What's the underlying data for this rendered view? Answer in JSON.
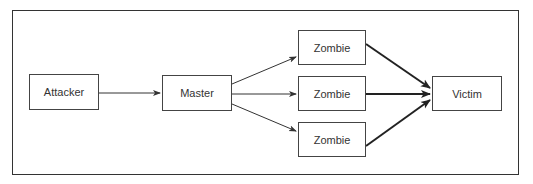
{
  "diagram": {
    "title": "",
    "nodes": [
      {
        "id": "attacker",
        "label": "Attacker"
      },
      {
        "id": "master",
        "label": "Master"
      },
      {
        "id": "zombie1",
        "label": "Zombie"
      },
      {
        "id": "zombie2",
        "label": "Zombie"
      },
      {
        "id": "zombie3",
        "label": "Zombie"
      },
      {
        "id": "victim",
        "label": "Victim"
      }
    ],
    "edges": [
      {
        "from": "attacker",
        "to": "master"
      },
      {
        "from": "master",
        "to": "zombie1"
      },
      {
        "from": "master",
        "to": "zombie2"
      },
      {
        "from": "master",
        "to": "zombie3"
      },
      {
        "from": "zombie1",
        "to": "victim",
        "weight": "bold"
      },
      {
        "from": "zombie2",
        "to": "victim",
        "weight": "bold"
      },
      {
        "from": "zombie3",
        "to": "victim",
        "weight": "bold"
      }
    ],
    "colors": {
      "stroke": "#333333",
      "text": "#333333",
      "background": "#ffffff"
    }
  }
}
